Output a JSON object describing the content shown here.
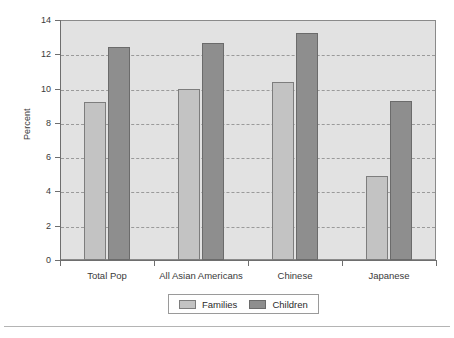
{
  "chart_data": {
    "type": "bar",
    "title": "",
    "xlabel": "",
    "ylabel": "Percent",
    "ylim": [
      0,
      14
    ],
    "yticks": [
      0,
      2,
      4,
      6,
      8,
      10,
      12,
      14
    ],
    "ytick_labels": [
      "0",
      "2",
      "4",
      "6",
      "8",
      "10",
      "12",
      "14"
    ],
    "grid": true,
    "grid_axis": "y",
    "grid_style": "dashed",
    "legend_position": "bottom-center",
    "categories": [
      "Total Pop",
      "All Asian Americans",
      "Chinese",
      "Japanese"
    ],
    "series": [
      {
        "name": "Families",
        "color": "#c3c3c3",
        "values": [
          9.2,
          10.0,
          10.4,
          4.9
        ]
      },
      {
        "name": "Children",
        "color": "#8e8e8e",
        "values": [
          12.4,
          12.65,
          13.25,
          9.3
        ]
      }
    ]
  },
  "legend": {
    "entries": [
      {
        "label": "Families",
        "swatch": "families"
      },
      {
        "label": "Children",
        "swatch": "children"
      }
    ]
  },
  "colors": {
    "plot_background": "#e2e2e2",
    "frame_border": "#8a8a8a",
    "gridline": "#9a9a9a",
    "axis": "#6e6e6e",
    "families_bar": "#c3c3c3",
    "children_bar": "#8e8e8e",
    "page_background": "#ffffff",
    "footer_rule": "#b4b4b4"
  }
}
